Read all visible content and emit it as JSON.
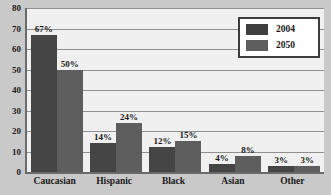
{
  "chart_data": {
    "type": "bar",
    "title": "",
    "xlabel": "",
    "ylabel": "",
    "ylim": [
      0,
      80
    ],
    "y_ticks": [
      80,
      70,
      60,
      50,
      40,
      30,
      20,
      10,
      0
    ],
    "grid": true,
    "legend_position": "top-right",
    "categories": [
      "Caucasian",
      "Hispanic",
      "Black",
      "Asian",
      "Other"
    ],
    "series": [
      {
        "name": "2004",
        "color": "#454545",
        "values": [
          67,
          14,
          12,
          4,
          3
        ],
        "data_labels": [
          "67%",
          "14%",
          "12%",
          "4%",
          "3%"
        ]
      },
      {
        "name": "2050",
        "color": "#5e5e5e",
        "values": [
          50,
          24,
          15,
          8,
          3
        ],
        "data_labels": [
          "50%",
          "24%",
          "15%",
          "8%",
          "3%"
        ]
      }
    ]
  },
  "legend": {
    "items": [
      {
        "label": "2004",
        "swatch": "legend-swatch-2004"
      },
      {
        "label": "2050",
        "swatch": "legend-swatch-2050"
      }
    ]
  },
  "colors": {
    "series_2004": "#454545",
    "series_2050": "#5e5e5e",
    "plot_background": "#f0f0f0",
    "page_background": "#c9c9c9",
    "axis": "#6a6a6a",
    "gridline": "#8f8f8f",
    "text": "#1a1a1a"
  }
}
